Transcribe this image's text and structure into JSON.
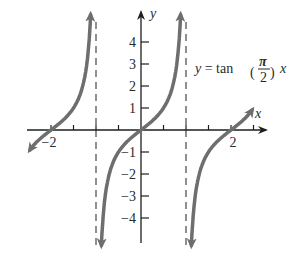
{
  "chart_data": {
    "type": "line",
    "title": "",
    "equation": {
      "prefix": "y = tan",
      "numerator": "π",
      "denominator": "2",
      "suffix": "x"
    },
    "xlabel": "x",
    "ylabel": "y",
    "xlim": [
      -2.5,
      2.7
    ],
    "ylim": [
      -5,
      5
    ],
    "x_tick_labels": [
      {
        "value": -2,
        "label": "−2"
      },
      {
        "value": 2,
        "label": "2"
      }
    ],
    "y_tick_labels": [
      {
        "value": 4,
        "label": "4"
      },
      {
        "value": 3,
        "label": "3"
      },
      {
        "value": 2,
        "label": "2"
      },
      {
        "value": 1,
        "label": "1"
      },
      {
        "value": -1,
        "label": "−1"
      },
      {
        "value": -2,
        "label": "−2"
      },
      {
        "value": -3,
        "label": "−3"
      },
      {
        "value": -4,
        "label": "−4"
      }
    ],
    "asymptotes": [
      -1,
      1
    ],
    "series": [
      {
        "name": "y = tan(π/2)x",
        "function": "tan(pi/2 * x)",
        "branches": [
          [
            -2.45,
            -1.05
          ],
          [
            -0.95,
            0.95
          ],
          [
            1.05,
            2.45
          ]
        ]
      }
    ],
    "grid": false,
    "colors": {
      "curve": "#6e6e6e",
      "axis": "#2a2a2a",
      "asymptote": "#555555"
    }
  }
}
